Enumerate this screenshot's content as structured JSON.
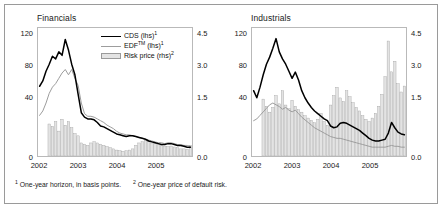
{
  "figure": {
    "footnotes": [
      "One-year horizon, in basis points.",
      "One-year price of default risk."
    ],
    "footnote_markers": [
      "1",
      "2"
    ],
    "colors": {
      "cds_line": "#000000",
      "edf_line": "#9d9d9d",
      "risk_price_bar_fill": "#e3e3e3",
      "risk_price_bar_edge": "#9a9a9a",
      "frame": "#9a9a9a",
      "plot_border": "#b9b9b9",
      "text": "#1a1a1a"
    }
  },
  "legend": {
    "position": "top-right-of-left-panel",
    "entries": [
      {
        "label": "CDS (lhs)",
        "marker": "1",
        "key": "line-dark"
      },
      {
        "label": "EDF",
        "tm": "TM",
        "suffix": " (lhs)",
        "marker": "1",
        "key": "line-grey"
      },
      {
        "label": "Risk price (rhs)",
        "marker": "2",
        "key": "bar-grey"
      }
    ]
  },
  "chart_data": [
    {
      "type": "line",
      "title": "Financials",
      "xlabel": "",
      "ylabel": "",
      "grid": false,
      "legend": "top-right",
      "x_ticks": [
        "2002",
        "2003",
        "2004",
        "2005"
      ],
      "xlim": [
        "2002-01",
        "2005-12"
      ],
      "left_axis": {
        "ticks": [
          0,
          40,
          80,
          120
        ],
        "ylim": [
          0,
          145
        ],
        "label": "basis points"
      },
      "right_axis": {
        "ticks": [
          "0.0",
          "1.5",
          "3.0",
          "4.5"
        ],
        "ylim": [
          0,
          5.4
        ],
        "label": "price of default risk"
      },
      "series": [
        {
          "name": "CDS (lhs)",
          "axis": "left",
          "style": "line-dark",
          "values": [
            79,
            85,
            96,
            104,
            113,
            110,
            118,
            114,
            132,
            120,
            104,
            92,
            70,
            49,
            44,
            42,
            42,
            41,
            38,
            34,
            33,
            31,
            29,
            27,
            25,
            24,
            23,
            22,
            23,
            23,
            22,
            21,
            20,
            19,
            17,
            16,
            15,
            14,
            13,
            13,
            14,
            14,
            13,
            12,
            12,
            11,
            10,
            10
          ]
        },
        {
          "name": "EDF (lhs)",
          "axis": "left",
          "style": "line-grey",
          "values": [
            46,
            51,
            60,
            71,
            78,
            82,
            88,
            94,
            98,
            92,
            98,
            88,
            80,
            60,
            48,
            45,
            45,
            44,
            42,
            40,
            38,
            35,
            33,
            31,
            28,
            26,
            25,
            24,
            24,
            23,
            22,
            21,
            20,
            19,
            18,
            17,
            16,
            15,
            15,
            14,
            15,
            15,
            14,
            13,
            13,
            12,
            12,
            11
          ]
        },
        {
          "name": "Risk price (rhs)",
          "axis": "right",
          "style": "bar-grey",
          "values": [
            0.0,
            0.0,
            0.0,
            1.35,
            1.25,
            1.45,
            1.05,
            1.55,
            1.3,
            1.45,
            1.2,
            0.95,
            0.85,
            0.55,
            0.5,
            0.45,
            0.55,
            0.6,
            0.55,
            0.5,
            0.45,
            0.4,
            0.35,
            0.3,
            0.25,
            0.22,
            0.2,
            0.22,
            0.25,
            0.3,
            0.45,
            0.55,
            0.6,
            0.65,
            0.6,
            0.55,
            0.55,
            0.5,
            0.45,
            0.42,
            0.4,
            0.42,
            0.38,
            0.35,
            0.3,
            0.3,
            0.28,
            0.45
          ]
        }
      ]
    },
    {
      "type": "line",
      "title": "Industrials",
      "xlabel": "",
      "ylabel": "",
      "grid": false,
      "legend": "none",
      "x_ticks": [
        "2002",
        "2003",
        "2004",
        "2005"
      ],
      "xlim": [
        "2002-01",
        "2005-12"
      ],
      "left_axis": {
        "ticks": [
          0,
          40,
          80,
          120
        ],
        "ylim": [
          0,
          145
        ],
        "label": "basis points"
      },
      "right_axis": {
        "ticks": [
          "0.0",
          "1.5",
          "3.0",
          "4.5"
        ],
        "ylim": [
          0,
          5.4
        ],
        "label": "price of default risk"
      },
      "series": [
        {
          "name": "CDS (lhs)",
          "axis": "left",
          "style": "line-dark",
          "values": [
            74,
            66,
            78,
            92,
            104,
            112,
            122,
            133,
            118,
            110,
            104,
            96,
            88,
            95,
            86,
            74,
            66,
            60,
            55,
            51,
            48,
            45,
            42,
            40,
            34,
            32,
            33,
            37,
            38,
            37,
            35,
            33,
            31,
            29,
            26,
            23,
            20,
            18,
            17,
            17,
            18,
            19,
            26,
            38,
            32,
            27,
            25,
            24
          ]
        },
        {
          "name": "EDF (lhs)",
          "axis": "left",
          "style": "line-grey",
          "values": [
            40,
            42,
            46,
            50,
            54,
            58,
            60,
            58,
            56,
            53,
            55,
            52,
            50,
            52,
            48,
            44,
            41,
            38,
            35,
            32,
            30,
            28,
            26,
            24,
            22,
            21,
            20,
            20,
            19,
            18,
            17,
            16,
            15,
            14,
            13,
            12,
            11,
            10,
            10,
            10,
            10,
            10,
            11,
            12,
            11,
            11,
            10,
            10
          ]
        },
        {
          "name": "Risk price (rhs)",
          "axis": "right",
          "style": "bar-grey",
          "values": [
            0.0,
            0.0,
            0.0,
            2.4,
            2.1,
            1.85,
            2.05,
            2.55,
            2.2,
            2.75,
            2.15,
            2.0,
            2.35,
            2.1,
            1.95,
            1.85,
            1.7,
            1.6,
            1.5,
            1.4,
            1.55,
            1.8,
            1.45,
            1.3,
            2.15,
            2.55,
            2.9,
            2.45,
            2.3,
            2.75,
            2.5,
            2.25,
            2.05,
            1.9,
            1.7,
            1.55,
            1.45,
            1.6,
            1.8,
            2.1,
            2.6,
            3.35,
            4.85,
            3.55,
            4.0,
            3.05,
            2.7,
            2.95
          ]
        }
      ]
    }
  ]
}
